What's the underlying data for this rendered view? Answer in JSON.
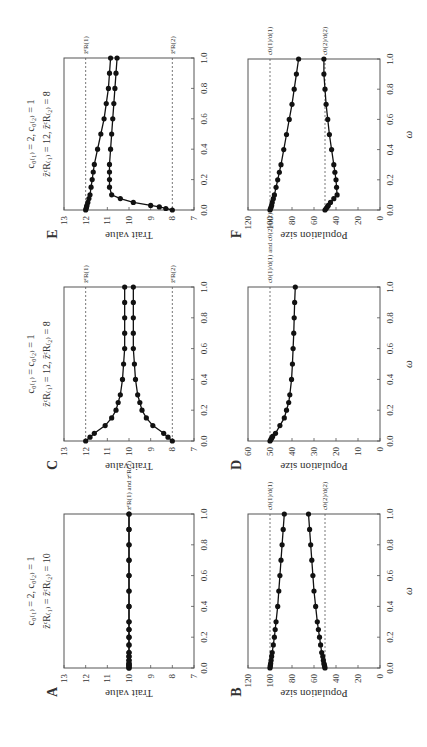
{
  "figure": {
    "rotation_note": "Figure is rotated 90 degrees; text reads bottom-to-top.",
    "panels": [
      "A",
      "B",
      "C",
      "D",
      "E",
      "F"
    ]
  },
  "chart_data": [
    {
      "panel": "A",
      "type": "line",
      "title": "c0(1) = 2, c0(2) = 1; zc_R(1) = zc_R(2) = 10",
      "header_line1": "c₀₍₁₎ = 2, c₀₍₂₎ = 1",
      "header_line2": "z̄ᶜR₍₁₎ = z̄ᶜR₍₂₎ = 10",
      "xlabel": "ω",
      "ylabel": "Trait value",
      "xlim": [
        0,
        1
      ],
      "ylim": [
        7,
        13
      ],
      "xticks": [
        "0.0",
        "0.2",
        "0.4",
        "0.6",
        "0.8",
        "1.0"
      ],
      "yticks": [
        "7",
        "8",
        "9",
        "10",
        "11",
        "12",
        "13"
      ],
      "x": [
        0,
        0.01,
        0.02,
        0.03,
        0.05,
        0.075,
        0.1,
        0.15,
        0.2,
        0.25,
        0.3,
        0.4,
        0.5,
        0.6,
        0.7,
        0.8,
        0.9,
        1.0
      ],
      "series": [
        {
          "name": "species 1",
          "values": [
            10,
            10,
            10,
            10,
            10,
            10,
            10,
            10,
            10,
            10,
            10,
            10,
            10,
            10,
            10,
            10,
            10,
            10
          ]
        },
        {
          "name": "species 2",
          "values": [
            10,
            10,
            10,
            10,
            10,
            10,
            10,
            10,
            10,
            10,
            10,
            10,
            10,
            10,
            10,
            10,
            10,
            10
          ]
        }
      ],
      "reference_lines": [
        {
          "value": 10,
          "label": "z̄ᶜR(1) and z̄ᶜR(2)"
        }
      ]
    },
    {
      "panel": "B",
      "type": "line",
      "xlabel": "ω",
      "ylabel": "Population size",
      "xlim": [
        0,
        1
      ],
      "ylim": [
        0,
        120
      ],
      "xticks": [
        "0.0",
        "0.2",
        "0.4",
        "0.6",
        "0.8",
        "1.0"
      ],
      "yticks": [
        "0",
        "20",
        "40",
        "60",
        "80",
        "100",
        "120"
      ],
      "x": [
        0,
        0.01,
        0.02,
        0.03,
        0.05,
        0.075,
        0.1,
        0.15,
        0.2,
        0.25,
        0.3,
        0.4,
        0.5,
        0.6,
        0.7,
        0.8,
        0.9,
        1.0
      ],
      "series": [
        {
          "name": "species 1",
          "values": [
            100,
            99.8,
            99.6,
            99.4,
            99,
            98.5,
            98,
            97,
            96,
            95.3,
            94.5,
            93,
            92,
            91,
            90,
            89,
            88,
            87
          ]
        },
        {
          "name": "species 2",
          "values": [
            50,
            50.3,
            50.6,
            51,
            51.5,
            52,
            53,
            54,
            55,
            56,
            57,
            58.5,
            60,
            61,
            62,
            63,
            64,
            65
          ]
        }
      ],
      "reference_lines": [
        {
          "value": 100,
          "label": "c0(1)/d(1)"
        },
        {
          "value": 50,
          "label": "c0(2)/d(2)"
        }
      ]
    },
    {
      "panel": "C",
      "type": "line",
      "header_line1": "c₀₍₁₎ = c₀₍₂₎ = 1",
      "header_line2": "z̄ᶜR₍₁₎ = 12, z̄ᶜR₍₂₎ = 8",
      "xlabel": "ω",
      "ylabel": "Trait value",
      "xlim": [
        0,
        1
      ],
      "ylim": [
        7,
        13
      ],
      "xticks": [
        "0.0",
        "0.2",
        "0.4",
        "0.6",
        "0.8",
        "1.0"
      ],
      "yticks": [
        "7",
        "8",
        "9",
        "10",
        "11",
        "12",
        "13"
      ],
      "x": [
        0,
        0.025,
        0.05,
        0.1,
        0.15,
        0.2,
        0.25,
        0.3,
        0.4,
        0.5,
        0.6,
        0.7,
        0.8,
        0.9,
        1.0
      ],
      "series": [
        {
          "name": "species 1",
          "values": [
            12,
            11.8,
            11.6,
            11.1,
            10.8,
            10.6,
            10.5,
            10.4,
            10.3,
            10.25,
            10.2,
            10.2,
            10.2,
            10.2,
            10.2
          ]
        },
        {
          "name": "species 2",
          "values": [
            8,
            8.2,
            8.4,
            8.9,
            9.2,
            9.4,
            9.5,
            9.6,
            9.7,
            9.75,
            9.8,
            9.8,
            9.8,
            9.8,
            9.8
          ]
        }
      ],
      "reference_lines": [
        {
          "value": 12,
          "label": "z̄ᶜR(1)"
        },
        {
          "value": 8,
          "label": "z̄ᶜR(2)"
        }
      ]
    },
    {
      "panel": "D",
      "type": "line",
      "xlabel": "ω",
      "ylabel": "Population size",
      "xlim": [
        0,
        1
      ],
      "ylim": [
        0,
        60
      ],
      "xticks": [
        "0.0",
        "0.2",
        "0.4",
        "0.6",
        "0.8",
        "1.0"
      ],
      "yticks": [
        "0",
        "10",
        "20",
        "30",
        "40",
        "50",
        "60"
      ],
      "x": [
        0,
        0.01,
        0.02,
        0.03,
        0.05,
        0.1,
        0.15,
        0.2,
        0.25,
        0.3,
        0.4,
        0.5,
        0.6,
        0.7,
        0.8,
        0.9,
        1.0
      ],
      "series": [
        {
          "name": "both species",
          "values": [
            50,
            49.6,
            49.2,
            48.8,
            47.5,
            45.5,
            43.5,
            42.5,
            41.5,
            41,
            40.2,
            39.8,
            39.5,
            39.2,
            39,
            38.8,
            38.5
          ]
        }
      ],
      "reference_lines": [
        {
          "value": 50,
          "label": "c0(1)/d(1) and c0(2)/d(2)"
        }
      ]
    },
    {
      "panel": "E",
      "type": "line",
      "header_line1": "c₀₍₁₎ = 2, c₀₍₂₎ = 1",
      "header_line2": "z̄ᶜR₍₁₎ = 12, z̄ᶜR₍₂₎ = 8",
      "xlabel": "ω",
      "ylabel": "Trait value",
      "xlim": [
        0,
        1
      ],
      "ylim": [
        7,
        13
      ],
      "xticks": [
        "0.0",
        "0.2",
        "0.4",
        "0.6",
        "0.8",
        "1.0"
      ],
      "yticks": [
        "7",
        "8",
        "9",
        "10",
        "11",
        "12",
        "13"
      ],
      "x": [
        0,
        0.01,
        0.02,
        0.03,
        0.05,
        0.075,
        0.1,
        0.15,
        0.2,
        0.25,
        0.3,
        0.4,
        0.5,
        0.6,
        0.7,
        0.8,
        0.9,
        1.0
      ],
      "series": [
        {
          "name": "species 1",
          "values": [
            12,
            11.98,
            11.96,
            11.94,
            11.9,
            11.85,
            11.8,
            11.75,
            11.7,
            11.65,
            11.6,
            11.45,
            11.3,
            11.15,
            11.05,
            10.95,
            10.9,
            10.85
          ]
        },
        {
          "name": "species 2",
          "values": [
            8,
            8.3,
            8.6,
            9.0,
            9.8,
            10.4,
            10.8,
            10.9,
            10.9,
            10.9,
            10.9,
            10.85,
            10.8,
            10.75,
            10.7,
            10.65,
            10.6,
            10.55
          ]
        }
      ],
      "reference_lines": [
        {
          "value": 12,
          "label": "z̄ᶜR(1)"
        },
        {
          "value": 8,
          "label": "z̄ᶜR(2)"
        }
      ]
    },
    {
      "panel": "F",
      "type": "line",
      "xlabel": "ω",
      "ylabel": "Population size",
      "xlim": [
        0,
        1
      ],
      "ylim": [
        0,
        120
      ],
      "xticks": [
        "0.0",
        "0.2",
        "0.4",
        "0.6",
        "0.8",
        "1.0"
      ],
      "yticks": [
        "0",
        "20",
        "40",
        "60",
        "80",
        "100",
        "120"
      ],
      "x": [
        0,
        0.01,
        0.02,
        0.03,
        0.05,
        0.075,
        0.1,
        0.15,
        0.2,
        0.25,
        0.3,
        0.4,
        0.5,
        0.6,
        0.7,
        0.8,
        0.9,
        1.0
      ],
      "series": [
        {
          "name": "species 1",
          "values": [
            100,
            99.5,
            99,
            98.5,
            98,
            97,
            96,
            94.5,
            93,
            91.5,
            90,
            87.5,
            85,
            82.5,
            80,
            78,
            76,
            74
          ]
        },
        {
          "name": "species 2",
          "values": [
            50,
            49,
            48,
            47,
            45,
            42,
            39,
            39.5,
            40,
            41,
            42,
            44,
            46,
            47.5,
            49,
            50,
            51,
            51
          ]
        }
      ],
      "reference_lines": [
        {
          "value": 100,
          "label": "c0(1)/d(1)"
        },
        {
          "value": 50,
          "label": "c0(2)/d(2)"
        }
      ]
    }
  ]
}
